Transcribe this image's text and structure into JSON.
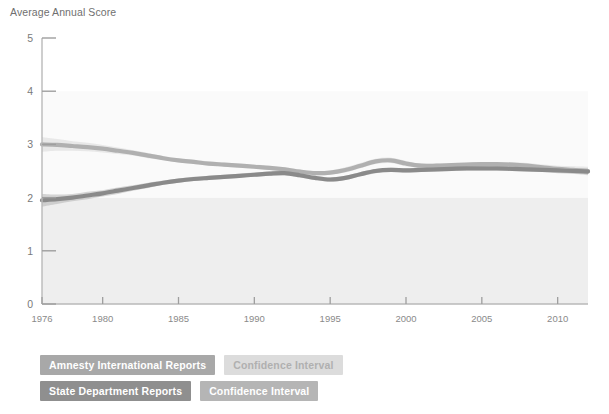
{
  "chart_data": {
    "type": "line",
    "title": "Average Annual Score",
    "xlabel": "",
    "ylabel": "Average Annual Score",
    "xlim": [
      1976,
      2012
    ],
    "ylim": [
      0,
      5
    ],
    "grid": false,
    "legend_position": "bottom-left",
    "yticks": [
      0,
      1,
      2,
      3,
      4,
      5
    ],
    "xticks": [
      1976,
      1980,
      1985,
      1990,
      1995,
      2000,
      2005,
      2010
    ],
    "x": [
      1976,
      1977,
      1978,
      1979,
      1980,
      1981,
      1982,
      1983,
      1984,
      1985,
      1986,
      1987,
      1988,
      1989,
      1990,
      1991,
      1992,
      1993,
      1994,
      1995,
      1996,
      1997,
      1998,
      1999,
      2000,
      2001,
      2002,
      2003,
      2004,
      2005,
      2006,
      2007,
      2008,
      2009,
      2010,
      2011,
      2012
    ],
    "series": [
      {
        "name": "Amnesty International Reports",
        "color": "#b0b0b0",
        "ci_color": "#d8d8d8",
        "values": [
          3.0,
          2.99,
          2.97,
          2.95,
          2.92,
          2.88,
          2.84,
          2.79,
          2.74,
          2.7,
          2.67,
          2.64,
          2.62,
          2.6,
          2.58,
          2.56,
          2.53,
          2.49,
          2.46,
          2.47,
          2.52,
          2.6,
          2.68,
          2.7,
          2.64,
          2.6,
          2.6,
          2.61,
          2.62,
          2.63,
          2.63,
          2.62,
          2.6,
          2.57,
          2.54,
          2.52,
          2.5
        ],
        "ci_lower": [
          2.86,
          2.88,
          2.88,
          2.87,
          2.85,
          2.82,
          2.79,
          2.74,
          2.7,
          2.66,
          2.63,
          2.6,
          2.58,
          2.56,
          2.54,
          2.52,
          2.49,
          2.45,
          2.42,
          2.43,
          2.47,
          2.55,
          2.63,
          2.65,
          2.59,
          2.56,
          2.56,
          2.57,
          2.58,
          2.59,
          2.59,
          2.57,
          2.55,
          2.52,
          2.48,
          2.45,
          2.42
        ],
        "ci_upper": [
          3.14,
          3.1,
          3.06,
          3.03,
          2.99,
          2.94,
          2.89,
          2.84,
          2.78,
          2.74,
          2.71,
          2.68,
          2.66,
          2.64,
          2.62,
          2.6,
          2.57,
          2.53,
          2.5,
          2.51,
          2.57,
          2.65,
          2.73,
          2.75,
          2.69,
          2.64,
          2.64,
          2.65,
          2.66,
          2.67,
          2.67,
          2.67,
          2.65,
          2.62,
          2.6,
          2.59,
          2.58
        ]
      },
      {
        "name": "State Department Reports",
        "color": "#8a8a8a",
        "ci_color": "#b5b5b5",
        "values": [
          1.95,
          1.97,
          2.0,
          2.04,
          2.08,
          2.13,
          2.18,
          2.23,
          2.28,
          2.32,
          2.35,
          2.37,
          2.39,
          2.41,
          2.43,
          2.45,
          2.46,
          2.42,
          2.37,
          2.34,
          2.37,
          2.44,
          2.5,
          2.52,
          2.51,
          2.52,
          2.53,
          2.54,
          2.55,
          2.55,
          2.55,
          2.54,
          2.53,
          2.52,
          2.51,
          2.5,
          2.49
        ],
        "ci_lower": [
          1.83,
          1.88,
          1.93,
          1.97,
          2.02,
          2.07,
          2.13,
          2.18,
          2.24,
          2.28,
          2.31,
          2.33,
          2.35,
          2.37,
          2.39,
          2.41,
          2.42,
          2.38,
          2.33,
          2.3,
          2.33,
          2.4,
          2.46,
          2.48,
          2.47,
          2.48,
          2.49,
          2.5,
          2.51,
          2.51,
          2.51,
          2.5,
          2.49,
          2.48,
          2.46,
          2.45,
          2.43
        ],
        "ci_upper": [
          2.07,
          2.06,
          2.07,
          2.11,
          2.14,
          2.19,
          2.23,
          2.28,
          2.32,
          2.36,
          2.39,
          2.41,
          2.43,
          2.45,
          2.47,
          2.49,
          2.5,
          2.46,
          2.41,
          2.38,
          2.41,
          2.48,
          2.54,
          2.56,
          2.55,
          2.56,
          2.57,
          2.58,
          2.59,
          2.59,
          2.59,
          2.58,
          2.57,
          2.56,
          2.56,
          2.55,
          2.55
        ]
      }
    ],
    "shaded_bands": [
      {
        "name": "band-0-2",
        "from": 0,
        "to": 2,
        "color": "#eeeeee"
      },
      {
        "name": "band-2-4",
        "from": 2,
        "to": 4,
        "color": "#fafafa"
      }
    ]
  },
  "legend": {
    "rows": [
      {
        "primary": "Amnesty International Reports",
        "ci": "Confidence Interval"
      },
      {
        "primary": "State Department Reports",
        "ci": "Confidence Interval"
      }
    ]
  }
}
